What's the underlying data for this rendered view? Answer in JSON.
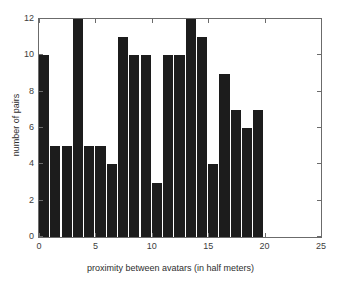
{
  "chart_data": {
    "type": "bar",
    "title": "",
    "subtitle": "",
    "xlabel": "proximity between avatars (in half meters)",
    "ylabel": "number of pairs",
    "xlim": [
      0,
      25
    ],
    "ylim": [
      0,
      12
    ],
    "xticks": [
      0,
      5,
      10,
      15,
      20,
      25
    ],
    "yticks": [
      0,
      2,
      4,
      6,
      8,
      10,
      12
    ],
    "xtick_labels": [
      "0",
      "5",
      "10",
      "15",
      "20",
      "25"
    ],
    "ytick_labels": [
      "0",
      "2",
      "4",
      "6",
      "8",
      "10",
      "12"
    ],
    "grid": false,
    "legend": null,
    "legend_position": "none",
    "bar_color": "#1c1c1c",
    "axis_color": "#6b6b6b",
    "bin_width": 1,
    "categories": [
      1,
      2,
      3,
      4,
      5,
      6,
      7,
      8,
      9,
      10,
      11,
      12,
      13,
      14,
      15,
      16,
      17,
      18,
      19,
      20
    ],
    "values": [
      10,
      5,
      5,
      12,
      5,
      5,
      4,
      11,
      10,
      10,
      3,
      10,
      10,
      12,
      11,
      4,
      9,
      7,
      6,
      7
    ],
    "series": [
      {
        "name": "number of pairs",
        "values": [
          10,
          5,
          5,
          12,
          5,
          5,
          4,
          11,
          10,
          10,
          3,
          10,
          10,
          12,
          11,
          4,
          9,
          7,
          6,
          7
        ]
      }
    ]
  }
}
